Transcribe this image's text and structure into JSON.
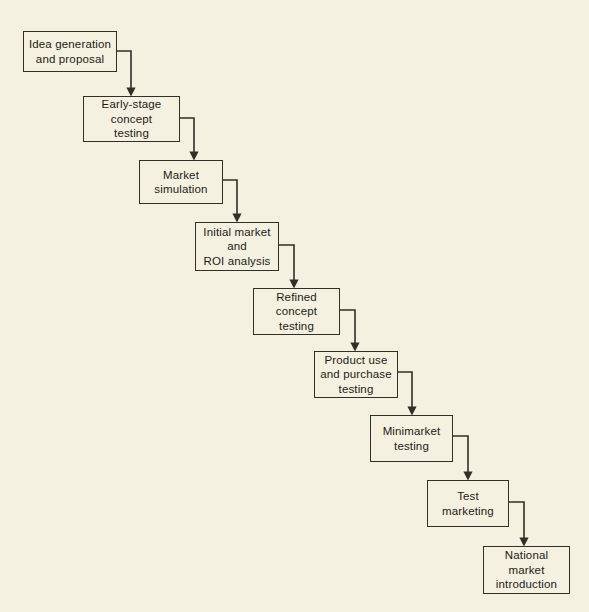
{
  "diagram": {
    "type": "cascading-flowchart",
    "background_color": "#f4f1e1",
    "line_color": "#312f26",
    "text_color": "#1d1b14",
    "steps": [
      {
        "id": "idea-generation-and-proposal",
        "label": "Idea generation\nand proposal",
        "order": 1,
        "x": 23,
        "y": 31,
        "width": 94,
        "height": 41
      },
      {
        "id": "early-stage-concept-testing",
        "label": "Early-stage\nconcept\ntesting",
        "order": 2,
        "x": 83,
        "y": 96,
        "width": 97,
        "height": 46
      },
      {
        "id": "market-simulation",
        "label": "Market\nsimulation",
        "order": 3,
        "x": 139,
        "y": 160,
        "width": 84,
        "height": 44
      },
      {
        "id": "initial-market-and-roi-analysis",
        "label": "Initial market\nand\nROI analysis",
        "order": 4,
        "x": 195,
        "y": 222,
        "width": 84,
        "height": 49
      },
      {
        "id": "refined-concept-testing",
        "label": "Refined\nconcept\ntesting",
        "order": 5,
        "x": 253,
        "y": 288,
        "width": 87,
        "height": 47
      },
      {
        "id": "product-use-and-purchase-testing",
        "label": "Product use\nand purchase\ntesting",
        "order": 6,
        "x": 314,
        "y": 351,
        "width": 84,
        "height": 47
      },
      {
        "id": "minimarket-testing",
        "label": "Minimarket\ntesting",
        "order": 7,
        "x": 370,
        "y": 415,
        "width": 83,
        "height": 47
      },
      {
        "id": "test-marketing",
        "label": "Test\nmarketing",
        "order": 8,
        "x": 427,
        "y": 480,
        "width": 82,
        "height": 47
      },
      {
        "id": "national-market-introduction",
        "label": "National\nmarket\nintroduction",
        "order": 9,
        "x": 483,
        "y": 546,
        "width": 87,
        "height": 48
      }
    ],
    "connectors": [
      {
        "id": "connector-1",
        "from": "idea-generation-and-proposal",
        "to": "early-stage-concept-testing",
        "path": "M117,51 L131,51 L131,93",
        "arrow_x": 131,
        "arrow_y": 95
      },
      {
        "id": "connector-2",
        "from": "early-stage-concept-testing",
        "to": "market-simulation",
        "path": "M180,118 L194,118 L194,157",
        "arrow_x": 194,
        "arrow_y": 159
      },
      {
        "id": "connector-3",
        "from": "market-simulation",
        "to": "initial-market-and-roi-analysis",
        "path": "M223,180 L237,180 L237,219",
        "arrow_x": 237,
        "arrow_y": 221
      },
      {
        "id": "connector-4",
        "from": "initial-market-and-roi-analysis",
        "to": "refined-concept-testing",
        "path": "M279,245 L294,245 L294,285",
        "arrow_x": 294,
        "arrow_y": 287
      },
      {
        "id": "connector-5",
        "from": "refined-concept-testing",
        "to": "product-use-and-purchase-testing",
        "path": "M340,310 L355,310 L355,348",
        "arrow_x": 355,
        "arrow_y": 350
      },
      {
        "id": "connector-6",
        "from": "product-use-and-purchase-testing",
        "to": "minimarket-testing",
        "path": "M398,372 L412,372 L412,412",
        "arrow_x": 412,
        "arrow_y": 414
      },
      {
        "id": "connector-7",
        "from": "minimarket-testing",
        "to": "test-marketing",
        "path": "M453,436 L468,436 L468,477",
        "arrow_x": 468,
        "arrow_y": 479
      },
      {
        "id": "connector-8",
        "from": "test-marketing",
        "to": "national-market-introduction",
        "path": "M509,502 L524,502 L524,543",
        "arrow_x": 524,
        "arrow_y": 545
      }
    ]
  }
}
